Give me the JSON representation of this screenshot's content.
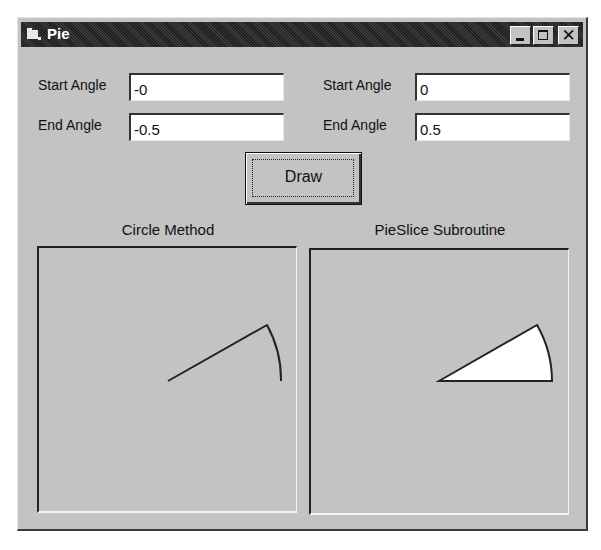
{
  "window": {
    "title": "Pie",
    "icon": "app-folder-icon",
    "controls": {
      "minimize": "minimize-icon",
      "maximize": "maximize-icon",
      "close": "close-icon",
      "close_glyph": "✕"
    }
  },
  "left_inputs": {
    "start_label": "Start Angle",
    "start_value": "-0",
    "end_label": "End Angle",
    "end_value": "-0.5"
  },
  "right_inputs": {
    "start_label": "Start Angle",
    "start_value": "0",
    "end_label": "End Angle",
    "end_value": "0.5"
  },
  "draw_button": {
    "label": "Draw"
  },
  "panels": {
    "left": {
      "caption": "Circle Method",
      "drawing": "arc-with-radius-line",
      "start_angle_rad": 0,
      "end_angle_rad": 0.5
    },
    "right": {
      "caption": "PieSlice Subroutine",
      "drawing": "filled-pie-slice",
      "fill_color": "#ffffff",
      "start_angle_rad": 0,
      "end_angle_rad": 0.5
    }
  },
  "colors": {
    "face": "#c3c3c3",
    "titlebar": "#2a2a2a",
    "ink": "#111111"
  }
}
